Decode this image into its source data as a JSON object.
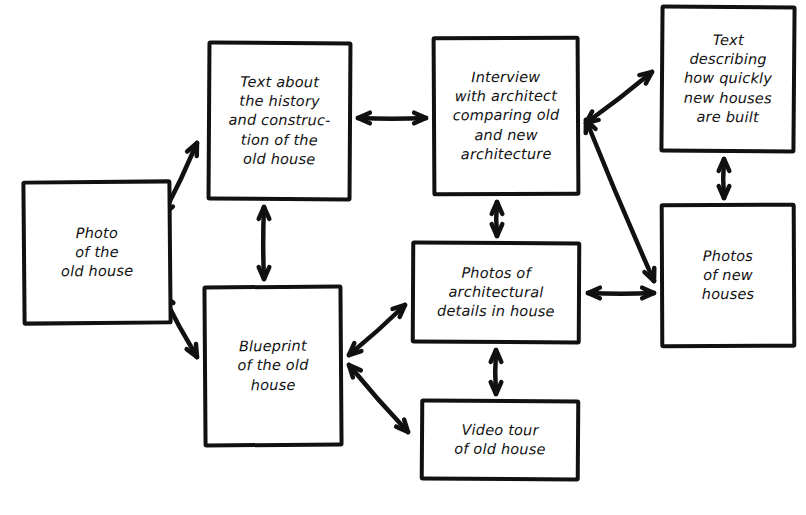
{
  "diagram": {
    "style": {
      "background": "#ffffff",
      "ink": "#111111",
      "box_fill": "#ffffff"
    },
    "nodes": [
      {
        "id": "photo-old-house",
        "label": "Photo\nof the\nold house",
        "x": 22,
        "y": 180,
        "w": 150,
        "h": 145
      },
      {
        "id": "text-history-construction",
        "label": "Text about\nthe history\nand construc-\ntion of the\nold house",
        "x": 207,
        "y": 41,
        "w": 145,
        "h": 160
      },
      {
        "id": "interview-architect",
        "label": "Interview\nwith architect\ncomparing old\nand new\narchitecture",
        "x": 432,
        "y": 36,
        "w": 148,
        "h": 160
      },
      {
        "id": "text-new-houses-speed",
        "label": "Text\ndescribing\nhow quickly\nnew houses\nare built",
        "x": 660,
        "y": 5,
        "w": 136,
        "h": 148
      },
      {
        "id": "blueprint-old-house",
        "label": "Blueprint\nof the old\nhouse",
        "x": 203,
        "y": 285,
        "w": 140,
        "h": 162
      },
      {
        "id": "photos-architectural-details",
        "label": "Photos of\narchitectural\ndetails in house",
        "x": 411,
        "y": 241,
        "w": 170,
        "h": 103
      },
      {
        "id": "photos-new-houses",
        "label": "Photos\nof new\nhouses",
        "x": 660,
        "y": 203,
        "w": 136,
        "h": 145
      },
      {
        "id": "video-tour-old-house",
        "label": "Video tour\nof old house",
        "x": 420,
        "y": 399,
        "w": 160,
        "h": 82
      }
    ],
    "edges": [
      {
        "id": "photo-to-text-history",
        "from": "photo-old-house",
        "to": "text-history-construction",
        "direction": "bidirectional",
        "x1": 163,
        "y1": 215,
        "x2": 197,
        "y2": 143
      },
      {
        "id": "photo-to-blueprint",
        "from": "photo-old-house",
        "to": "blueprint-old-house",
        "direction": "bidirectional",
        "x1": 163,
        "y1": 295,
        "x2": 197,
        "y2": 357
      },
      {
        "id": "text-history-to-interview",
        "from": "text-history-construction",
        "to": "interview-architect",
        "direction": "bidirectional",
        "x1": 358,
        "y1": 118,
        "x2": 426,
        "y2": 118
      },
      {
        "id": "text-history-to-blueprint",
        "from": "text-history-construction",
        "to": "blueprint-old-house",
        "direction": "bidirectional",
        "x1": 264,
        "y1": 207,
        "x2": 264,
        "y2": 279
      },
      {
        "id": "interview-to-text-new-houses",
        "from": "interview-architect",
        "to": "text-new-houses-speed",
        "direction": "bidirectional",
        "x1": 586,
        "y1": 123,
        "x2": 652,
        "y2": 72
      },
      {
        "id": "interview-to-photos-new-houses",
        "from": "interview-architect",
        "to": "photos-new-houses",
        "direction": "bidirectional",
        "x1": 586,
        "y1": 120,
        "x2": 654,
        "y2": 281
      },
      {
        "id": "interview-to-photos-details",
        "from": "interview-architect",
        "to": "photos-architectural-details",
        "direction": "bidirectional",
        "x1": 497,
        "y1": 202,
        "x2": 497,
        "y2": 236
      },
      {
        "id": "text-new-houses-to-photos-new-houses",
        "from": "text-new-houses-speed",
        "to": "photos-new-houses",
        "direction": "bidirectional",
        "x1": 724,
        "y1": 159,
        "x2": 724,
        "y2": 198
      },
      {
        "id": "photos-details-to-photos-new-houses",
        "from": "photos-architectural-details",
        "to": "photos-new-houses",
        "direction": "bidirectional",
        "x1": 588,
        "y1": 293,
        "x2": 654,
        "y2": 293
      },
      {
        "id": "blueprint-to-photos-details",
        "from": "blueprint-old-house",
        "to": "photos-architectural-details",
        "direction": "bidirectional",
        "x1": 349,
        "y1": 355,
        "x2": 405,
        "y2": 305
      },
      {
        "id": "blueprint-to-video-tour",
        "from": "blueprint-old-house",
        "to": "video-tour-old-house",
        "direction": "bidirectional",
        "x1": 349,
        "y1": 365,
        "x2": 408,
        "y2": 432
      },
      {
        "id": "photos-details-to-video-tour",
        "from": "photos-architectural-details",
        "to": "video-tour-old-house",
        "direction": "bidirectional",
        "x1": 496,
        "y1": 350,
        "x2": 496,
        "y2": 394
      }
    ]
  }
}
